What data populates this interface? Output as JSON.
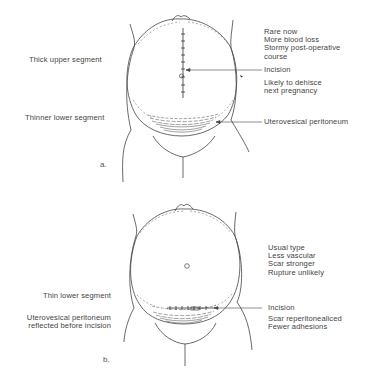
{
  "figure_a": {
    "sublabel": "a.",
    "left_labels": {
      "upper": "Thick upper segment",
      "lower": "Thinner lower segment"
    },
    "right_notes": [
      "Rare now",
      "More blood loss",
      "Stormy post-operative",
      "course"
    ],
    "incision_label": "Incision",
    "incision_notes": [
      "Likely to dehisce",
      "next pregnancy"
    ],
    "peritoneum_label": "Uterovesical peritoneum"
  },
  "figure_b": {
    "sublabel": "b.",
    "left_labels": {
      "lower": "Thin  lower segment",
      "peritoneum": [
        "Uterovesical peritoneum",
        "reflected before incision"
      ]
    },
    "right_notes": [
      "Usual type",
      "Less vascular",
      "Scar stronger",
      "Rupture unlikely"
    ],
    "incision_label": "Incision",
    "incision_notes": [
      "Scar reperitonealiced",
      "Fewer adhesions"
    ]
  },
  "colors": {
    "line": "#444444",
    "dashed": "#777777",
    "text": "#444444"
  }
}
